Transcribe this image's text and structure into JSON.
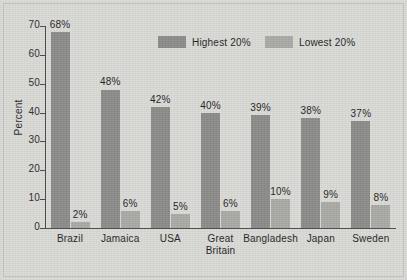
{
  "chart_data": {
    "type": "bar",
    "title": "",
    "xlabel": "",
    "ylabel": "Percent",
    "ylim": [
      0,
      70
    ],
    "yticks": [
      0,
      10,
      20,
      30,
      40,
      50,
      60,
      70
    ],
    "grid": false,
    "legend_position": "top-center",
    "categories": [
      "Brazil",
      "Jamaica",
      "USA",
      "Great Britain",
      "Bangladesh",
      "Japan",
      "Sweden"
    ],
    "category_lines": [
      [
        "Brazil"
      ],
      [
        "Jamaica"
      ],
      [
        "USA"
      ],
      [
        "Great",
        "Britain"
      ],
      [
        "Bangladesh"
      ],
      [
        "Japan"
      ],
      [
        "Sweden"
      ]
    ],
    "series": [
      {
        "name": "Highest 20%",
        "color": "#8b8b89",
        "values": [
          68,
          48,
          42,
          40,
          39,
          38,
          37
        ],
        "labels": [
          "68%",
          "48%",
          "42%",
          "40%",
          "39%",
          "38%",
          "37%"
        ]
      },
      {
        "name": "Lowest 20%",
        "color": "#a9a9a6",
        "values": [
          2,
          6,
          5,
          6,
          10,
          9,
          8
        ],
        "labels": [
          "2%",
          "6%",
          "5%",
          "6%",
          "10%",
          "9%",
          "8%"
        ]
      }
    ]
  },
  "legend": {
    "items": [
      {
        "label": "Highest 20%",
        "color": "#8b8b89"
      },
      {
        "label": "Lowest 20%",
        "color": "#a9a9a6"
      }
    ]
  },
  "axis": {
    "y_label": "Percent",
    "y_tick_labels": [
      "0",
      "10",
      "20",
      "30",
      "40",
      "50",
      "60",
      "70"
    ]
  },
  "colors": {
    "background": "#d9d9d6",
    "axis": "#4a4a48",
    "text": "#1f1f1f",
    "highest_bar": "#8b8b89",
    "lowest_bar": "#a9a9a6"
  }
}
